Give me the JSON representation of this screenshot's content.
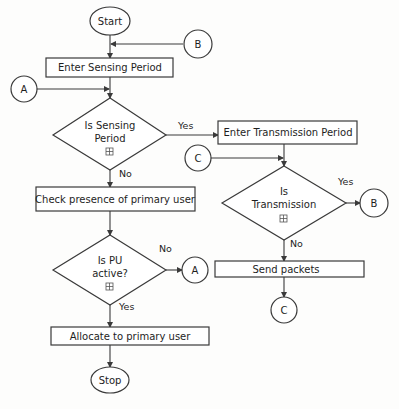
{
  "diagram": {
    "type": "flowchart",
    "terminals": {
      "start": "Start",
      "stop": "Stop"
    },
    "processes": {
      "enter_sensing": "Enter Sensing Period",
      "check_presence": "Check presence of primary user",
      "allocate": "Allocate to primary user",
      "enter_transmission": "Enter Transmission Period",
      "send_packets": "Send packets"
    },
    "decisions": {
      "sensing": {
        "line1": "Is Sensing",
        "line2": "Period",
        "icon": "expand-icon"
      },
      "pu_active": {
        "line1": "Is PU",
        "line2": "active?",
        "icon": "expand-icon"
      },
      "transmission": {
        "line1": "Is",
        "line2": "Transmission",
        "icon": "expand-icon"
      }
    },
    "connectors": {
      "b_top": "B",
      "a_left": "A",
      "c_left": "C",
      "b_right": "B",
      "a_right": "A",
      "c_bottom": "C"
    },
    "edge_labels": {
      "sensing_yes": "Yes",
      "sensing_no": "No",
      "pu_no": "No",
      "pu_yes": "Yes",
      "transmission_yes": "Yes",
      "transmission_no": "No"
    }
  }
}
